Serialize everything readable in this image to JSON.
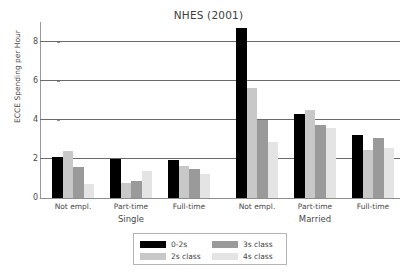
{
  "chart_data": {
    "type": "bar",
    "title": "NHES (2001)",
    "xlabel": "",
    "ylabel": "ECCE Spending per Hour",
    "ylim": [
      0,
      9
    ],
    "yticks": [
      0,
      2,
      4,
      6,
      8
    ],
    "ytick_labels": [
      "0",
      "2",
      "4",
      "6",
      "8"
    ],
    "grid": "horizontal",
    "legend_position": "bottom-center",
    "group_labels": [
      "Single",
      "Married"
    ],
    "categories": [
      "Not empl.",
      "Part-time",
      "Full-time",
      "Not empl.",
      "Part-time",
      "Full-time"
    ],
    "series": [
      {
        "name": "0-2s",
        "color": "#000000",
        "values": [
          2.1,
          2.0,
          1.95,
          8.7,
          4.3,
          3.2
        ]
      },
      {
        "name": "2s class",
        "color": "#c8c8c8",
        "values": [
          2.4,
          0.78,
          1.65,
          5.65,
          4.5,
          2.45
        ]
      },
      {
        "name": "3s class",
        "color": "#9a9a9a",
        "values": [
          1.6,
          0.88,
          1.48,
          4.0,
          3.75,
          3.05
        ]
      },
      {
        "name": "4s class",
        "color": "#e4e4e4",
        "values": [
          0.72,
          1.38,
          1.25,
          2.85,
          3.6,
          2.55
        ]
      }
    ]
  },
  "legend": {
    "entries": [
      {
        "label": "0-2s",
        "color": "#000000"
      },
      {
        "label": "2s class",
        "color": "#c8c8c8"
      },
      {
        "label": "3s class",
        "color": "#9a9a9a"
      },
      {
        "label": "4s class",
        "color": "#e4e4e4"
      }
    ]
  },
  "axis": {
    "gridline_color": "#6a6a6a",
    "axis_color": "#8e8e8e",
    "text_color": "#4a4a4a"
  }
}
